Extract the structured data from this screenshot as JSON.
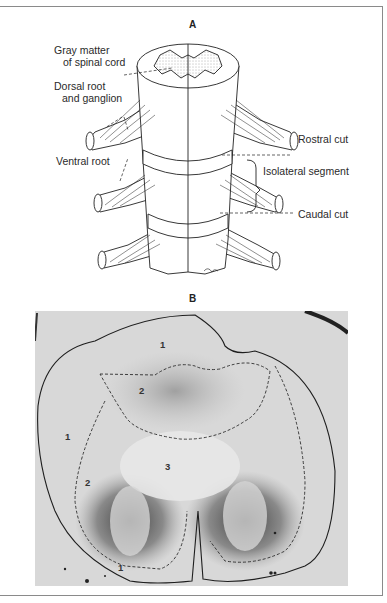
{
  "figure": {
    "panel_a": {
      "label": "A",
      "callouts": {
        "gray_matter_line1": "Gray matter",
        "gray_matter_line2": "of spinal cord",
        "dorsal_root_line1": "Dorsal root",
        "dorsal_root_line2": "and ganglion",
        "ventral_root": "Ventral root",
        "rostral_cut": "Rostral cut",
        "isolateral_segment": "Isolateral segment",
        "caudal_cut": "Caudal cut"
      }
    },
    "panel_b": {
      "label": "B",
      "region_labels": {
        "top_1": "1",
        "top_2": "2",
        "left_1": "1",
        "left_2": "2",
        "center_3": "3",
        "bottom_1": "1"
      }
    }
  }
}
